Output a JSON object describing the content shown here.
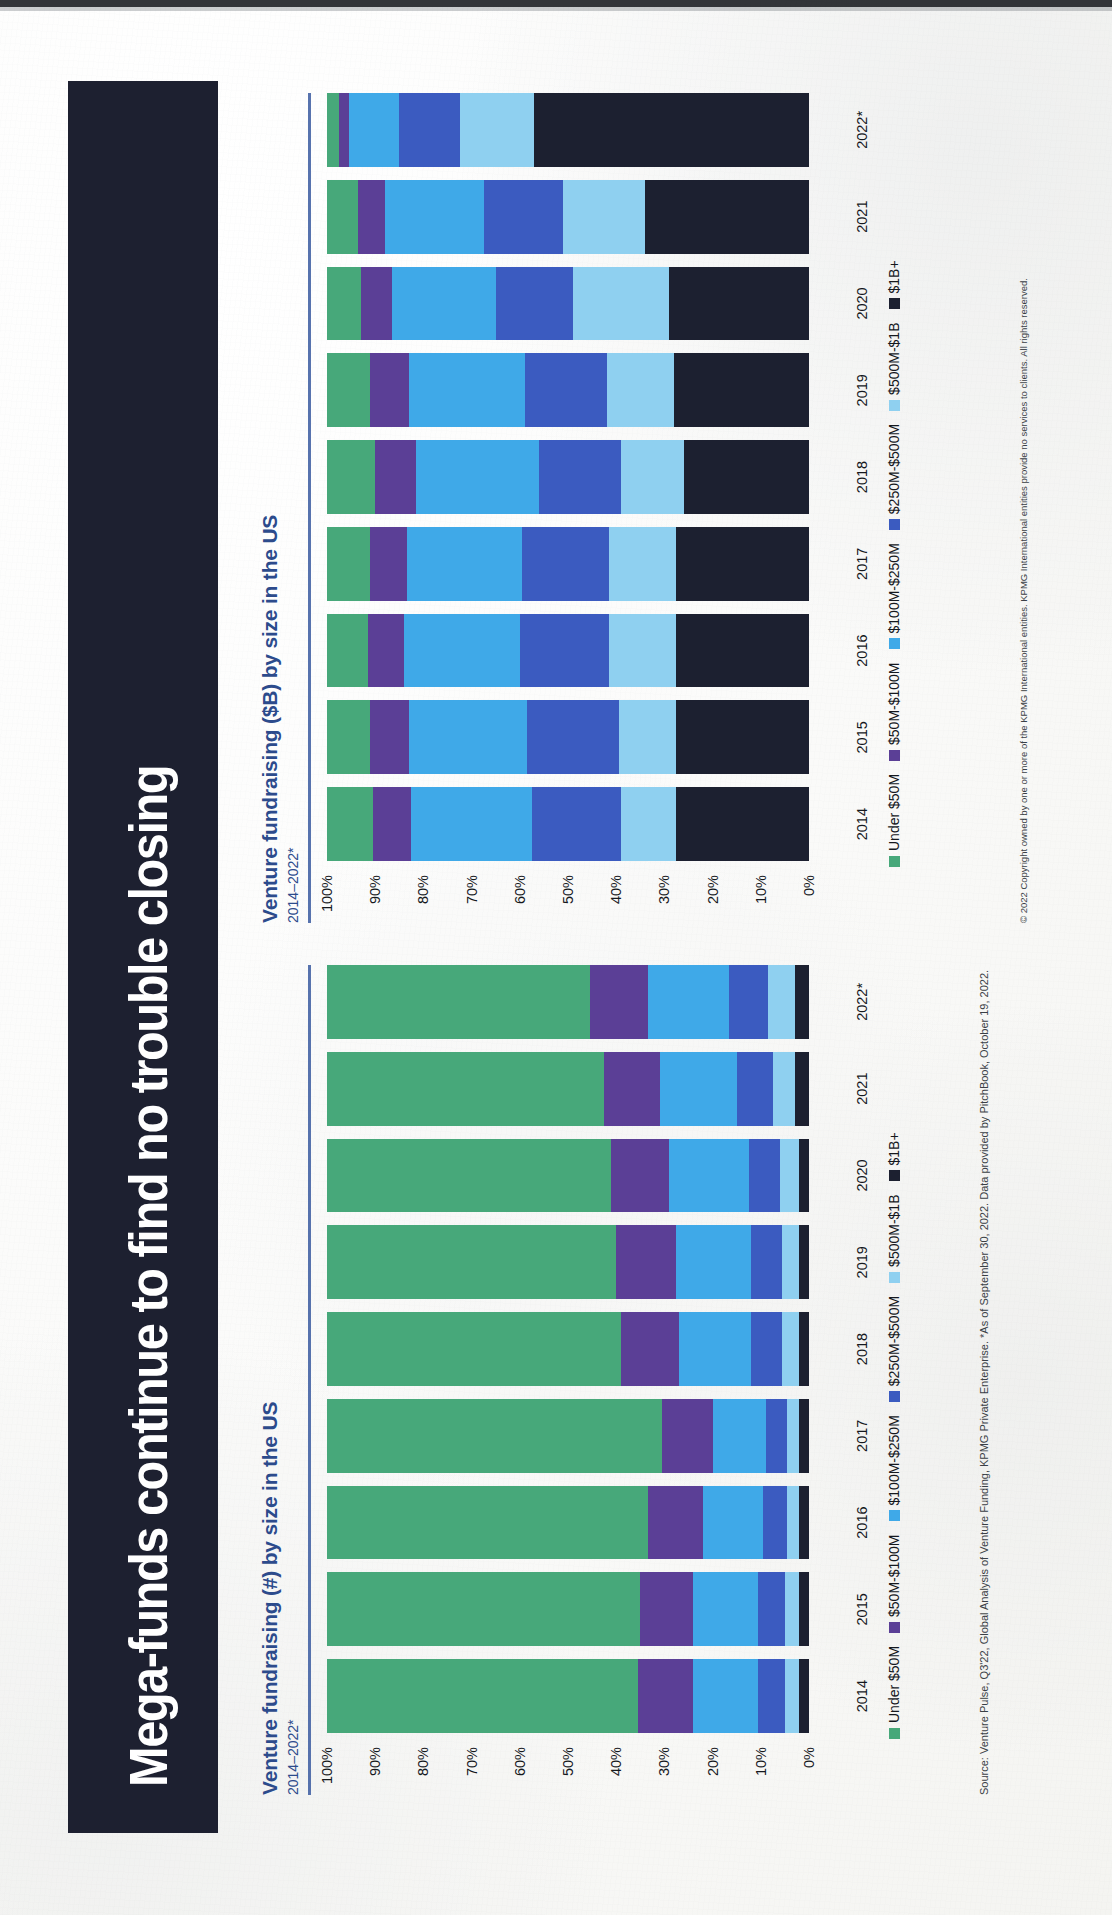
{
  "slide": {
    "title": "Mega-funds continue to find no trouble closing",
    "title_band_color": "#1d2030",
    "accent_color": "#2c4b8c"
  },
  "source_note": "Source: Venture Pulse, Q3'22, Global Analysis of Venture Funding, KPMG Private Enterprise. *As of September 30, 2022. Data provided by PitchBook, October 19, 2022.",
  "copyright_note": "© 2022 Copyright owned by one or more of the KPMG International entities. KPMG International entities provide no services to clients. All rights reserved.",
  "legend": {
    "items": [
      {
        "label": "Under $50M",
        "color": "#47a87a"
      },
      {
        "label": "$50M-$100M",
        "color": "#5b3f96"
      },
      {
        "label": "$100M-$250M",
        "color": "#3fa9e8"
      },
      {
        "label": "$250M-$500M",
        "color": "#3b5bc0"
      },
      {
        "label": "$500M-$1B",
        "color": "#8fd0f0"
      },
      {
        "label": "$1B+",
        "color": "#1c2030"
      }
    ]
  },
  "charts": {
    "count": {
      "title": "Venture fundraising (#) by size in the US",
      "subtitle": "2014–2022*"
    },
    "amount": {
      "title": "Venture fundraising ($B) by size in the US",
      "subtitle": "2014–2022*"
    }
  },
  "chart_data": [
    {
      "id": "count",
      "type": "bar",
      "stacked": true,
      "normalized": true,
      "title": "Venture fundraising (#) by size in the US",
      "subtitle": "2014–2022*",
      "xlabel": "",
      "ylabel": "",
      "ylim": [
        0,
        100
      ],
      "grid": false,
      "legend_position": "bottom",
      "ytick_labels": [
        "100%",
        "90%",
        "80%",
        "70%",
        "60%",
        "50%",
        "40%",
        "30%",
        "20%",
        "10%",
        "0%"
      ],
      "categories": [
        "2014",
        "2015",
        "2016",
        "2017",
        "2018",
        "2019",
        "2020",
        "2021",
        "2022*"
      ],
      "series": [
        {
          "name": "Under $50M",
          "color": "#47a87a",
          "values": [
            64.5,
            65.0,
            66.5,
            69.5,
            61.0,
            60.0,
            59.0,
            57.5,
            54.5
          ]
        },
        {
          "name": "$50M-$100M",
          "color": "#5b3f96",
          "values": [
            11.5,
            11.0,
            11.5,
            10.5,
            12.0,
            12.5,
            12.0,
            11.5,
            12.0
          ]
        },
        {
          "name": "$100M-$250M",
          "color": "#3fa9e8",
          "values": [
            13.5,
            13.5,
            12.5,
            11.0,
            15.0,
            15.5,
            16.5,
            16.0,
            17.0
          ]
        },
        {
          "name": "$250M-$500M",
          "color": "#3b5bc0",
          "values": [
            5.5,
            5.5,
            5.0,
            4.5,
            6.5,
            6.5,
            6.5,
            7.5,
            8.0
          ]
        },
        {
          "name": "$500M-$1B",
          "color": "#8fd0f0",
          "values": [
            3.0,
            3.0,
            2.5,
            2.5,
            3.5,
            3.5,
            4.0,
            4.5,
            5.5
          ]
        },
        {
          "name": "$1B+",
          "color": "#1c2030",
          "values": [
            2.0,
            2.0,
            2.0,
            2.0,
            2.0,
            2.0,
            2.0,
            3.0,
            3.0
          ]
        }
      ]
    },
    {
      "id": "amount",
      "type": "bar",
      "stacked": true,
      "normalized": true,
      "title": "Venture fundraising ($B) by size in the US",
      "subtitle": "2014–2022*",
      "xlabel": "",
      "ylabel": "",
      "ylim": [
        0,
        100
      ],
      "grid": false,
      "legend_position": "bottom",
      "ytick_labels": [
        "100%",
        "90%",
        "80%",
        "70%",
        "60%",
        "50%",
        "40%",
        "30%",
        "20%",
        "10%",
        "0%"
      ],
      "categories": [
        "2014",
        "2015",
        "2016",
        "2017",
        "2018",
        "2019",
        "2020",
        "2021",
        "2022*"
      ],
      "series": [
        {
          "name": "Under $50M",
          "color": "#47a87a",
          "values": [
            9.5,
            9.0,
            8.5,
            9.0,
            10.0,
            9.0,
            7.0,
            6.5,
            2.5
          ]
        },
        {
          "name": "$50M-$100M",
          "color": "#5b3f96",
          "values": [
            8.0,
            8.0,
            7.5,
            7.5,
            8.5,
            8.0,
            6.5,
            5.5,
            2.0
          ]
        },
        {
          "name": "$100M-$250M",
          "color": "#3fa9e8",
          "values": [
            25.0,
            24.5,
            24.0,
            24.0,
            25.5,
            24.0,
            21.5,
            20.5,
            10.5
          ]
        },
        {
          "name": "$250M-$500M",
          "color": "#3b5bc0",
          "values": [
            18.5,
            19.0,
            18.5,
            18.0,
            17.0,
            17.0,
            16.0,
            16.5,
            12.5
          ]
        },
        {
          "name": "$500M-$1B",
          "color": "#8fd0f0",
          "values": [
            11.5,
            12.0,
            14.0,
            14.0,
            13.0,
            14.0,
            20.0,
            17.0,
            15.5
          ]
        },
        {
          "name": "$1B+",
          "color": "#1c2030",
          "values": [
            27.5,
            27.5,
            27.5,
            27.5,
            26.0,
            28.0,
            29.0,
            34.0,
            57.0
          ]
        }
      ]
    }
  ]
}
